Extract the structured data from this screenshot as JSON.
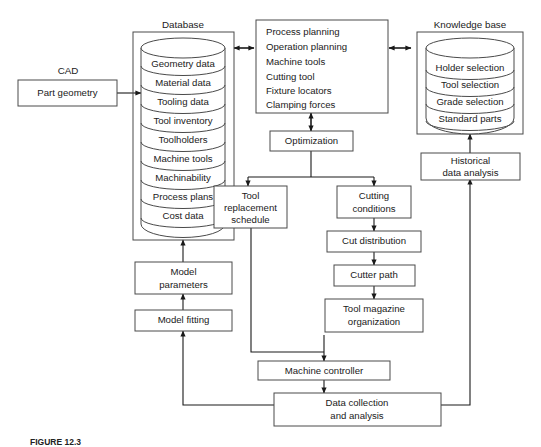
{
  "figure": {
    "background_color": "#ffffff",
    "line_color": "#4a4a4a",
    "text_color": "#1a1a1a"
  },
  "cad": {
    "title": "CAD",
    "box_label": "Part geometry"
  },
  "database": {
    "title": "Database",
    "layers": [
      "Geometry data",
      "Material data",
      "Tooling data",
      "Tool inventory",
      "Toolholders",
      "Machine tools",
      "Machinability",
      "Process plans",
      "Cost data"
    ]
  },
  "knowledge_base": {
    "title": "Knowledge base",
    "layers": [
      "Holder selection",
      "Tool selection",
      "Grade selection",
      "Standard parts"
    ]
  },
  "planning": {
    "lines": [
      "Process planning",
      "Operation planning",
      "Machine tools",
      "Cutting tool",
      "Fixture locators",
      "Clamping forces"
    ]
  },
  "boxes": {
    "optimization": [
      "Optimization"
    ],
    "tool_replacement_schedule": [
      "Tool",
      "replacement",
      "schedule"
    ],
    "cutting_conditions": [
      "Cutting",
      "conditions"
    ],
    "cut_distribution": [
      "Cut distribution"
    ],
    "cutter_path": [
      "Cutter path"
    ],
    "tool_magazine_organization": [
      "Tool magazine",
      "organization"
    ],
    "machine_controller": [
      "Machine controller"
    ],
    "data_collection": [
      "Data collection",
      "and analysis"
    ],
    "historical_data_analysis": [
      "Historical",
      "data analysis"
    ],
    "model_parameters": [
      "Model",
      "parameters"
    ],
    "model_fitting": [
      "Model fitting"
    ]
  },
  "caption": {
    "prefix": "FIGURE 12.3",
    "text": ""
  }
}
